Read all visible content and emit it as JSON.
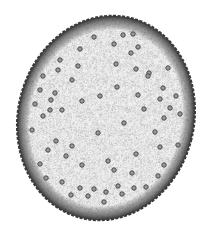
{
  "figure": {
    "colors": {
      "background": "#ffffff",
      "tissue": "#f1f1f1",
      "stipple": "#8a8a8a",
      "rim": "#3a3a3a",
      "bundle": "#4a4a4a"
    },
    "outline": {
      "cx": 106,
      "cy": 118,
      "rx": 88,
      "ry": 103,
      "rotate": 14
    },
    "bundles": [
      [
        94,
        37
      ],
      [
        123,
        35
      ],
      [
        133,
        34
      ],
      [
        80,
        49
      ],
      [
        114,
        44
      ],
      [
        138,
        47
      ],
      [
        60,
        60
      ],
      [
        131,
        53
      ],
      [
        58,
        70
      ],
      [
        78,
        66
      ],
      [
        116,
        64
      ],
      [
        43,
        76
      ],
      [
        136,
        69
      ],
      [
        149,
        73
      ],
      [
        168,
        68
      ],
      [
        72,
        80
      ],
      [
        148,
        76
      ],
      [
        40,
        90
      ],
      [
        55,
        93
      ],
      [
        163,
        88
      ],
      [
        117,
        87
      ],
      [
        138,
        95
      ],
      [
        35,
        104
      ],
      [
        51,
        100
      ],
      [
        82,
        101
      ],
      [
        100,
        96
      ],
      [
        160,
        99
      ],
      [
        176,
        96
      ],
      [
        164,
        118
      ],
      [
        43,
        116
      ],
      [
        50,
        110
      ],
      [
        62,
        110
      ],
      [
        144,
        109
      ],
      [
        170,
        108
      ],
      [
        180,
        114
      ],
      [
        124,
        123
      ],
      [
        98,
        133
      ],
      [
        155,
        132
      ],
      [
        32,
        130
      ],
      [
        56,
        141
      ],
      [
        160,
        147
      ],
      [
        72,
        146
      ],
      [
        136,
        154
      ],
      [
        178,
        145
      ],
      [
        40,
        164
      ],
      [
        66,
        156
      ],
      [
        48,
        150
      ],
      [
        108,
        161
      ],
      [
        82,
        165
      ],
      [
        114,
        170
      ],
      [
        164,
        165
      ],
      [
        46,
        178
      ],
      [
        158,
        176
      ],
      [
        132,
        173
      ],
      [
        62,
        182
      ],
      [
        80,
        188
      ],
      [
        94,
        189
      ],
      [
        134,
        188
      ],
      [
        106,
        192
      ],
      [
        118,
        186
      ],
      [
        146,
        187
      ],
      [
        122,
        194
      ],
      [
        104,
        202
      ],
      [
        88,
        196
      ],
      [
        71,
        195
      ]
    ]
  }
}
